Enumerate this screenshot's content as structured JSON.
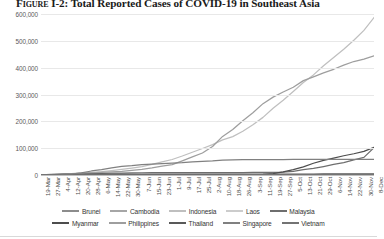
{
  "figure": {
    "label": "Figure I-2:",
    "title": "Total Reported Cases of COVID-19 in Southeast Asia",
    "full_title": "Figure I-2: Total Reported Cases of COVID-19 in Southeast Asia"
  },
  "chart_data": {
    "type": "line",
    "title": "Figure I-2: Total Reported Cases of COVID-19 in Southeast Asia",
    "subtitle": "",
    "xlabel": "",
    "ylabel": "",
    "grid": true,
    "legend_position": "bottom",
    "ylim": [
      0,
      600000
    ],
    "yticks": [
      0,
      100000,
      200000,
      300000,
      400000,
      500000,
      600000
    ],
    "ytick_labels": [
      "0",
      "100,000",
      "200,000",
      "300,000",
      "400,000",
      "500,000",
      "600,000"
    ],
    "x": [
      "19-Mar",
      "27-Mar",
      "4-Apr",
      "12-Apr",
      "20-Apr",
      "28-Apr",
      "6-May",
      "14-May",
      "22-May",
      "30-May",
      "7-Jun",
      "15-Jun",
      "23-Jun",
      "1-Jul",
      "9-Jul",
      "17-Jul",
      "25-Jul",
      "2-Aug",
      "10-Aug",
      "18-Aug",
      "26-Aug",
      "3-Sep",
      "11-Sep",
      "19-Sep",
      "27-Sep",
      "5-Oct",
      "13-Oct",
      "21-Oct",
      "29-Oct",
      "6-Nov",
      "14-Nov",
      "22-Nov",
      "30-Nov",
      "8-Dec"
    ],
    "series": [
      {
        "name": "Brunei",
        "color": "#8c8c8c",
        "values": [
          50,
          120,
          135,
          136,
          138,
          138,
          141,
          141,
          141,
          141,
          141,
          141,
          141,
          141,
          141,
          141,
          141,
          141,
          142,
          142,
          144,
          145,
          145,
          145,
          146,
          146,
          148,
          148,
          148,
          148,
          150,
          150,
          151,
          152
        ]
      },
      {
        "name": "Cambodia",
        "color": "#a6a6a6",
        "values": [
          37,
          99,
          114,
          122,
          122,
          122,
          122,
          123,
          124,
          125,
          126,
          129,
          130,
          141,
          165,
          197,
          225,
          240,
          268,
          273,
          274,
          275,
          275,
          275,
          277,
          280,
          283,
          285,
          291,
          300,
          304,
          306,
          331,
          350
        ]
      },
      {
        "name": "Indonesia",
        "color": "#bfbfbf",
        "values": [
          309,
          1046,
          1986,
          4241,
          6760,
          9511,
          12438,
          16496,
          20796,
          25773,
          31186,
          39294,
          49009,
          57770,
          70736,
          84882,
          98778,
          113134,
          130718,
          143043,
          162884,
          187537,
          214746,
          248852,
          278722,
          311176,
          344749,
          373109,
          406945,
          437716,
          468875,
          502110,
          538883,
          586842
        ]
      },
      {
        "name": "Laos",
        "color": "#cccccc",
        "values": [
          0,
          6,
          11,
          19,
          19,
          19,
          19,
          19,
          19,
          19,
          19,
          19,
          19,
          19,
          19,
          19,
          20,
          20,
          20,
          22,
          22,
          22,
          23,
          23,
          23,
          23,
          24,
          24,
          24,
          24,
          24,
          25,
          39,
          41
        ]
      },
      {
        "name": "Malaysia",
        "color": "#6e6e6e",
        "values": [
          900,
          2031,
          3483,
          4817,
          5425,
          5851,
          6467,
          6855,
          7185,
          7762,
          8402,
          8505,
          8590,
          8640,
          8729,
          8769,
          8884,
          9002,
          9149,
          9257,
          9306,
          9374,
          9810,
          10219,
          11135,
          13504,
          19627,
          24514,
          31548,
          39357,
          46209,
          56659,
          65697,
          102000
        ]
      },
      {
        "name": "Myanmar",
        "color": "#4d4d4d",
        "values": [
          0,
          8,
          22,
          41,
          119,
          150,
          176,
          181,
          201,
          228,
          244,
          287,
          293,
          313,
          336,
          345,
          353,
          358,
          374,
          419,
          552,
          1020,
          2132,
          5541,
          11631,
          20033,
          30437,
          43788,
          54607,
          63265,
          71730,
          79246,
          87977,
          103000
        ]
      },
      {
        "name": "Philippines",
        "color": "#9e9e9e",
        "values": [
          217,
          803,
          3246,
          4932,
          6599,
          8212,
          10004,
          11876,
          13434,
          17224,
          21340,
          26420,
          33069,
          38511,
          52914,
          67456,
          82040,
          106330,
          143749,
          169213,
          202361,
          232072,
          265888,
          290190,
          309303,
          327168,
          351750,
          365799,
          380729,
          393961,
          409574,
          422915,
          431630,
          444164
        ]
      },
      {
        "name": "Thailand",
        "color": "#595959",
        "values": [
          272,
          1245,
          2067,
          2579,
          2792,
          2931,
          3004,
          3025,
          3037,
          3077,
          3112,
          3135,
          3156,
          3173,
          3202,
          3239,
          3291,
          3351,
          3376,
          3382,
          3403,
          3427,
          3475,
          3506,
          3545,
          3590,
          3652,
          3719,
          3759,
          3830,
          3892,
          3922,
          3998,
          4107
        ]
      },
      {
        "name": "Singapore",
        "color": "#808080",
        "values": [
          345,
          732,
          1189,
          2918,
          8014,
          14951,
          20198,
          26891,
          32343,
          34884,
          38965,
          40818,
          42736,
          44479,
          46283,
          49098,
          50838,
          52825,
          55661,
          56031,
          56852,
          57091,
          57454,
          57621,
          57765,
          57876,
          57951,
          57999,
          58036,
          58073,
          58124,
          58180,
          58218,
          58273
        ]
      },
      {
        "name": "Vietnam",
        "color": "#737373",
        "values": [
          76,
          163,
          239,
          260,
          268,
          270,
          271,
          288,
          324,
          328,
          332,
          334,
          355,
          355,
          370,
          382,
          431,
          621,
          911,
          989,
          1034,
          1046,
          1060,
          1068,
          1077,
          1100,
          1126,
          1148,
          1177,
          1213,
          1281,
          1321,
          1346,
          1367
        ]
      }
    ]
  },
  "legend": {
    "rows": [
      [
        {
          "label": "Brunei",
          "color": "#8c8c8c"
        },
        {
          "label": "Cambodia",
          "color": "#a6a6a6"
        },
        {
          "label": "Indonesia",
          "color": "#bfbfbf"
        },
        {
          "label": "Laos",
          "color": "#cccccc"
        },
        {
          "label": "Malaysia",
          "color": "#6e6e6e"
        }
      ],
      [
        {
          "label": "Myanmar",
          "color": "#4d4d4d"
        },
        {
          "label": "Philippines",
          "color": "#9e9e9e"
        },
        {
          "label": "Thailand",
          "color": "#595959"
        },
        {
          "label": "Singapore",
          "color": "#808080"
        },
        {
          "label": "Vietnam",
          "color": "#737373"
        }
      ]
    ]
  }
}
